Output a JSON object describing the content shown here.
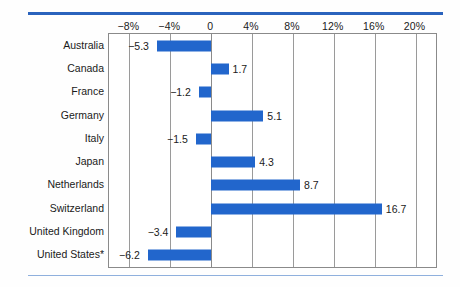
{
  "chart_data": {
    "type": "bar",
    "orientation": "horizontal",
    "title": "",
    "subtitle": "",
    "xlabel": "",
    "ylabel": "",
    "categories": [
      "Australia",
      "Canada",
      "France",
      "Germany",
      "Italy",
      "Japan",
      "Netherlands",
      "Switzerland",
      "United Kingdom",
      "United States*"
    ],
    "values": [
      -5.3,
      1.7,
      -1.2,
      5.1,
      -1.5,
      4.3,
      8.7,
      16.7,
      -3.4,
      -6.2
    ],
    "value_labels": [
      "−5.3",
      "1.7",
      "−1.2",
      "5.1",
      "−1.5",
      "4.3",
      "8.7",
      "16.7",
      "−3.4",
      "−6.2"
    ],
    "xlim": [
      -10,
      22
    ],
    "xticks": [
      -8,
      -4,
      0,
      4,
      8,
      12,
      16,
      20
    ],
    "xtick_labels": [
      "−8%",
      "−4%",
      "0",
      "4%",
      "8%",
      "12%",
      "16%",
      "20%"
    ],
    "grid": true,
    "legend": null,
    "bar_color": "#2266cc",
    "rule_color_top": "#2a63bd",
    "rule_color_bottom": "#8fb0dd",
    "frame_color": "#8a8a8a"
  }
}
